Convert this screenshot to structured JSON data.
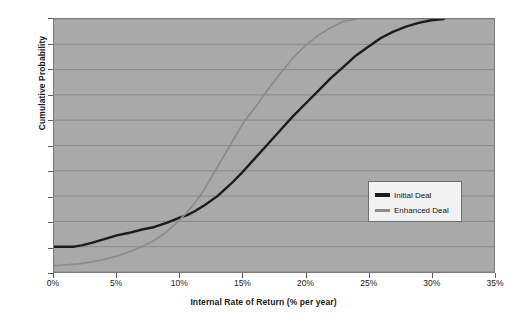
{
  "chart_data": {
    "type": "line",
    "title": "",
    "xlabel": "Internal Rate of Return (% per year)",
    "ylabel": "Cumulative Probability",
    "xlim": [
      0,
      35
    ],
    "ylim": [
      0,
      1.0
    ],
    "xticks": [
      "0%",
      "5%",
      "10%",
      "15%",
      "20%",
      "25%",
      "30%",
      "35%"
    ],
    "xtick_values": [
      0,
      5,
      10,
      15,
      20,
      25,
      30,
      35
    ],
    "yticks": [
      "0.0",
      "0.1",
      "0.2",
      "0.3",
      "0.4",
      "0.5",
      "0.6",
      "0.7",
      "0.8",
      "0.9",
      "1.0"
    ],
    "ytick_values": [
      0.0,
      0.1,
      0.2,
      0.3,
      0.4,
      0.5,
      0.6,
      0.7,
      0.8,
      0.9,
      1.0
    ],
    "grid": "horizontal",
    "plot_background": "#a9a9a9",
    "gridline_color": "#8a8a8a",
    "legend_position": "center-right",
    "series": [
      {
        "name": "Initial Deal",
        "color": "#1c1c1c",
        "width": 2.4,
        "x": [
          0.0,
          1.0,
          1.6,
          2.2,
          3.0,
          4.0,
          5.0,
          6.0,
          7.0,
          8.0,
          9.0,
          10.0,
          10.6,
          11.2,
          12.0,
          13.0,
          14.0,
          15.0,
          16.0,
          17.0,
          18.0,
          19.0,
          20.0,
          21.0,
          22.0,
          23.0,
          24.0,
          25.0,
          26.0,
          27.0,
          28.0,
          29.0,
          30.0,
          31.0
        ],
        "y": [
          0.1,
          0.1,
          0.1,
          0.105,
          0.115,
          0.13,
          0.145,
          0.155,
          0.168,
          0.178,
          0.195,
          0.215,
          0.225,
          0.24,
          0.265,
          0.3,
          0.345,
          0.395,
          0.45,
          0.505,
          0.56,
          0.615,
          0.665,
          0.715,
          0.765,
          0.81,
          0.855,
          0.89,
          0.925,
          0.95,
          0.97,
          0.985,
          0.995,
          1.0
        ]
      },
      {
        "name": "Enhanced Deal",
        "color": "#8d8d8d",
        "width": 1.8,
        "x": [
          0.0,
          1.0,
          2.0,
          3.0,
          4.0,
          5.0,
          6.0,
          7.0,
          8.0,
          9.0,
          10.0,
          11.0,
          11.6,
          12.0,
          13.0,
          14.0,
          15.0,
          15.6,
          16.0,
          17.0,
          18.0,
          19.0,
          20.0,
          21.0,
          22.0,
          23.0,
          24.0
        ],
        "y": [
          0.025,
          0.028,
          0.032,
          0.04,
          0.05,
          0.063,
          0.08,
          0.1,
          0.125,
          0.16,
          0.205,
          0.26,
          0.3,
          0.33,
          0.415,
          0.5,
          0.585,
          0.625,
          0.65,
          0.72,
          0.785,
          0.845,
          0.895,
          0.935,
          0.965,
          0.99,
          1.0
        ]
      }
    ]
  }
}
